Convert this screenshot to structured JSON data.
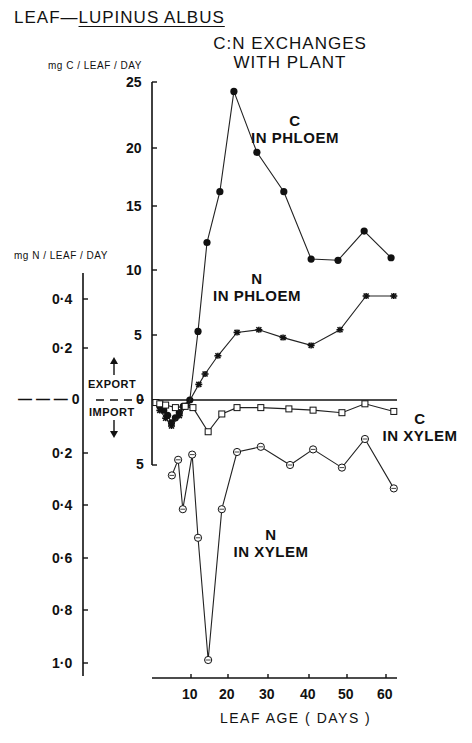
{
  "header": {
    "title_prefix": "LEAF—",
    "title_species": "LUPINUS ALBUS",
    "subtitle_line1": "C:N EXCHANGES",
    "subtitle_line2": "WITH PLANT"
  },
  "axes": {
    "c_axis_label": "mg C / LEAF / DAY",
    "n_axis_label": "mg N / LEAF / DAY",
    "x_axis_label": "LEAF AGE ( DAYS )",
    "export_label": "EXPORT",
    "import_label": "IMPORT",
    "c_ticks": [
      "25",
      "20",
      "15",
      "10",
      "5",
      "0",
      "5"
    ],
    "n_ticks": [
      "0·4",
      "0·2",
      "— — — 0",
      "0·2",
      "0·4",
      "0·6",
      "0·8",
      "1·0"
    ],
    "x_ticks": [
      "10",
      "20",
      "30",
      "40",
      "50",
      "60"
    ]
  },
  "series_labels": {
    "c_phloem": {
      "letter": "C",
      "text": "IN PHLOEM"
    },
    "n_phloem": {
      "letter": "N",
      "text": "IN PHLOEM"
    },
    "c_xylem": {
      "letter": "C",
      "text": "IN XYLEM"
    },
    "n_xylem": {
      "letter": "N",
      "text": "IN XYLEM"
    }
  },
  "chart_data": {
    "type": "line",
    "xlabel": "LEAF AGE (DAYS)",
    "ylabel_left": "mg N / LEAF / DAY",
    "ylabel_right_inner": "mg C / LEAF / DAY",
    "xlim": [
      0,
      63
    ],
    "ylim_c": [
      -5,
      25
    ],
    "ylim_n": [
      -1.0,
      0.5
    ],
    "annotations": [
      "EXPORT (positive, above 0)",
      "IMPORT (negative, below 0)"
    ],
    "grid": false,
    "legend": "inline labels",
    "series": [
      {
        "name": "C in phloem",
        "axis": "C",
        "marker": "filled-circle",
        "x": [
          2,
          3,
          4,
          5,
          6,
          7,
          8,
          9.7,
          11.8,
          14.1,
          17.4,
          21,
          26.9,
          33.8,
          40.8,
          47.7,
          54.4,
          61.3
        ],
        "y": [
          -0.5,
          -0.8,
          -1.2,
          -1.8,
          -1.4,
          -1.0,
          -0.5,
          0,
          5.4,
          12.4,
          16.4,
          24.3,
          19.5,
          16.4,
          11.1,
          11.0,
          13.3,
          11.2
        ]
      },
      {
        "name": "N in phloem",
        "axis": "N",
        "marker": "star",
        "x": [
          2,
          3.5,
          5,
          7,
          9,
          12,
          13.6,
          16.9,
          21.8,
          27.4,
          33.6,
          40.8,
          48.2,
          54.9,
          62
        ],
        "y": [
          -0.04,
          -0.07,
          -0.1,
          -0.06,
          -0.02,
          0.06,
          0.1,
          0.17,
          0.26,
          0.27,
          0.24,
          0.21,
          0.27,
          0.4,
          0.4
        ]
      },
      {
        "name": "C in xylem",
        "axis": "C",
        "marker": "open-square",
        "x": [
          1,
          2,
          3.5,
          6,
          8.5,
          10.5,
          14.4,
          17.9,
          21.8,
          27.9,
          35.1,
          41.3,
          48.7,
          54.6,
          62
        ],
        "y": [
          -0.2,
          -0.3,
          -0.4,
          -0.6,
          -0.5,
          -0.6,
          -2.5,
          -1.1,
          -0.6,
          -0.6,
          -0.7,
          -0.8,
          -1.0,
          -0.3,
          -0.9
        ]
      },
      {
        "name": "N in xylem",
        "axis": "N",
        "marker": "open-circle",
        "x": [
          5.1,
          6.7,
          7.9,
          10.3,
          11.8,
          14.4,
          17.9,
          21.8,
          27.9,
          35.4,
          41.3,
          48.7,
          54.6,
          62
        ],
        "y": [
          -0.29,
          -0.23,
          -0.42,
          -0.21,
          -0.53,
          -1.0,
          -0.42,
          -0.2,
          -0.18,
          -0.25,
          -0.19,
          -0.26,
          -0.15,
          -0.34
        ]
      }
    ]
  }
}
